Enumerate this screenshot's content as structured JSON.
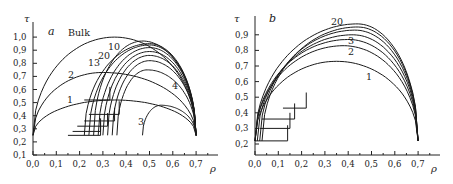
{
  "chart_data": [
    {
      "panel": "a",
      "type": "line",
      "title": "",
      "xlabel": "ρ",
      "ylabel": "τ",
      "xlim": [
        0.0,
        0.75
      ],
      "ylim": [
        0.1,
        1.05
      ],
      "xticks": [
        "0,0",
        "0,1",
        "0,2",
        "0,3",
        "0,4",
        "0,5",
        "0,6",
        "0,7"
      ],
      "yticks": [
        "0,1",
        "0,2",
        "0,3",
        "0,4",
        "0,5",
        "0,6",
        "0,7",
        "0,8",
        "0,9",
        "1,0"
      ],
      "grid": false,
      "curve_labels": [
        "Bulk",
        "1",
        "2",
        "3",
        "4",
        "10",
        "13",
        "20"
      ],
      "series": [
        {
          "name": "Bulk",
          "rho_min": 0.0,
          "rho_max": 0.7,
          "tau_base": 0.25,
          "tau_peak": 1.0,
          "rho_peak": 0.35
        },
        {
          "name": "2",
          "rho_min": 0.0,
          "rho_max": 0.7,
          "tau_base": 0.25,
          "tau_peak": 0.73,
          "rho_peak": 0.3
        },
        {
          "name": "1",
          "rho_min": 0.0,
          "rho_max": 0.7,
          "tau_base": 0.25,
          "tau_peak": 0.52,
          "rho_peak": 0.35
        },
        {
          "name": "3",
          "rho_min": 0.47,
          "rho_max": 0.7,
          "tau_base": 0.25,
          "tau_peak": 0.48,
          "rho_peak": 0.55
        },
        {
          "name": "4",
          "rho_min": 0.36,
          "rho_max": 0.7,
          "tau_base": 0.25,
          "tau_peak": 0.75,
          "rho_peak": 0.49
        },
        {
          "name": "5",
          "rho_min": 0.34,
          "rho_max": 0.7,
          "tau_base": 0.25,
          "tau_peak": 0.82,
          "rho_peak": 0.5
        },
        {
          "name": "6",
          "rho_min": 0.32,
          "rho_max": 0.7,
          "tau_base": 0.25,
          "tau_peak": 0.86,
          "rho_peak": 0.5
        },
        {
          "name": "7",
          "rho_min": 0.3,
          "rho_max": 0.7,
          "tau_base": 0.25,
          "tau_peak": 0.89,
          "rho_peak": 0.5
        },
        {
          "name": "8",
          "rho_min": 0.28,
          "rho_max": 0.7,
          "tau_base": 0.25,
          "tau_peak": 0.92,
          "rho_peak": 0.5
        },
        {
          "name": "10",
          "rho_min": 0.26,
          "rho_max": 0.7,
          "tau_base": 0.25,
          "tau_peak": 0.97,
          "rho_peak": 0.47
        },
        {
          "name": "13",
          "rho_min": 0.22,
          "rho_max": 0.7,
          "tau_base": 0.25,
          "tau_peak": 0.95,
          "rho_peak": 0.5
        },
        {
          "name": "20",
          "rho_min": 0.24,
          "rho_max": 0.7,
          "tau_base": 0.25,
          "tau_peak": 0.94,
          "rho_peak": 0.5
        }
      ],
      "steps": [
        {
          "rho": 0.15,
          "tau": 0.25,
          "to_rho": 0.29
        },
        {
          "rho": 0.17,
          "tau": 0.28,
          "to_rho": 0.29
        },
        {
          "rho": 0.19,
          "tau": 0.32,
          "to_rho": 0.32
        },
        {
          "rho": 0.22,
          "tau": 0.36,
          "to_rho": 0.35
        },
        {
          "rho": 0.24,
          "tau": 0.41,
          "to_rho": 0.37
        },
        {
          "rho": 0.22,
          "tau": 0.52,
          "to_rho": 0.33
        }
      ]
    },
    {
      "panel": "b",
      "type": "line",
      "title": "",
      "xlabel": "ρ",
      "ylabel": "τ",
      "xlim": [
        0.0,
        0.75
      ],
      "ylim": [
        0.2,
        0.98
      ],
      "xticks": [
        "0,0",
        "0,1",
        "0,2",
        "0,3",
        "0,4",
        "0,5",
        "0,6",
        "0,7"
      ],
      "yticks": [
        "0,2",
        "0,3",
        "0,4",
        "0,5",
        "0,6",
        "0,7",
        "0,8",
        "0,9"
      ],
      "grid": false,
      "curve_labels": [
        "1",
        "2",
        "3",
        "20"
      ],
      "series": [
        {
          "name": "1",
          "rho_min": 0.0,
          "rho_max": 0.7,
          "tau_base": 0.22,
          "tau_peak": 0.73,
          "rho_peak": 0.35
        },
        {
          "name": "2",
          "rho_min": 0.0,
          "rho_max": 0.7,
          "tau_base": 0.22,
          "tau_peak": 0.83,
          "rho_peak": 0.38
        },
        {
          "name": "3",
          "rho_min": 0.0,
          "rho_max": 0.7,
          "tau_base": 0.22,
          "tau_peak": 0.87,
          "rho_peak": 0.4
        },
        {
          "name": "4",
          "rho_min": 0.01,
          "rho_max": 0.7,
          "tau_base": 0.22,
          "tau_peak": 0.9,
          "rho_peak": 0.42
        },
        {
          "name": "6",
          "rho_min": 0.02,
          "rho_max": 0.7,
          "tau_base": 0.22,
          "tau_peak": 0.93,
          "rho_peak": 0.43
        },
        {
          "name": "10",
          "rho_min": 0.03,
          "rho_max": 0.7,
          "tau_base": 0.22,
          "tau_peak": 0.95,
          "rho_peak": 0.44
        },
        {
          "name": "20",
          "rho_min": 0.0,
          "rho_max": 0.7,
          "tau_base": 0.22,
          "tau_peak": 0.97,
          "rho_peak": 0.44
        }
      ],
      "steps": [
        {
          "rho": 0.0,
          "tau": 0.22,
          "to_rho": 0.14
        },
        {
          "rho": 0.02,
          "tau": 0.3,
          "to_rho": 0.15
        },
        {
          "rho": 0.03,
          "tau": 0.36,
          "to_rho": 0.17
        },
        {
          "rho": 0.12,
          "tau": 0.43,
          "to_rho": 0.22
        }
      ]
    }
  ]
}
